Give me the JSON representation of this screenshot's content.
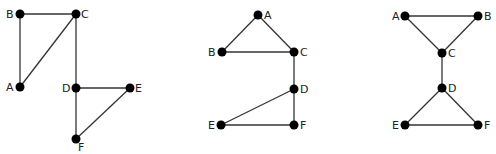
{
  "graphs": [
    {
      "id": "graph-1",
      "nodes": [
        {
          "label": "A",
          "x": 20,
          "y": 87,
          "lx": 6,
          "ly": 91
        },
        {
          "label": "B",
          "x": 20,
          "y": 14,
          "lx": 6,
          "ly": 18
        },
        {
          "label": "C",
          "x": 76,
          "y": 14,
          "lx": 81,
          "ly": 18
        },
        {
          "label": "D",
          "x": 76,
          "y": 88,
          "lx": 62,
          "ly": 92
        },
        {
          "label": "E",
          "x": 130,
          "y": 88,
          "lx": 135,
          "ly": 92
        },
        {
          "label": "F",
          "x": 76,
          "y": 139,
          "lx": 78,
          "ly": 151
        }
      ],
      "edges": [
        [
          "A",
          "B"
        ],
        [
          "B",
          "C"
        ],
        [
          "A",
          "C"
        ],
        [
          "C",
          "D"
        ],
        [
          "D",
          "E"
        ],
        [
          "D",
          "F"
        ],
        [
          "E",
          "F"
        ]
      ]
    },
    {
      "id": "graph-2",
      "nodes": [
        {
          "label": "A",
          "x": 258,
          "y": 15,
          "lx": 264,
          "ly": 19
        },
        {
          "label": "B",
          "x": 222,
          "y": 52,
          "lx": 208,
          "ly": 56
        },
        {
          "label": "C",
          "x": 294,
          "y": 52,
          "lx": 300,
          "ly": 56
        },
        {
          "label": "D",
          "x": 294,
          "y": 89,
          "lx": 300,
          "ly": 93
        },
        {
          "label": "E",
          "x": 221,
          "y": 125,
          "lx": 208,
          "ly": 129
        },
        {
          "label": "F",
          "x": 294,
          "y": 125,
          "lx": 300,
          "ly": 129
        }
      ],
      "edges": [
        [
          "A",
          "B"
        ],
        [
          "A",
          "C"
        ],
        [
          "B",
          "C"
        ],
        [
          "C",
          "D"
        ],
        [
          "D",
          "E"
        ],
        [
          "D",
          "F"
        ],
        [
          "E",
          "F"
        ]
      ]
    },
    {
      "id": "graph-3",
      "nodes": [
        {
          "label": "A",
          "x": 405,
          "y": 16,
          "lx": 392,
          "ly": 20
        },
        {
          "label": "B",
          "x": 478,
          "y": 16,
          "lx": 484,
          "ly": 20
        },
        {
          "label": "C",
          "x": 442,
          "y": 53,
          "lx": 448,
          "ly": 57
        },
        {
          "label": "D",
          "x": 442,
          "y": 88,
          "lx": 448,
          "ly": 92
        },
        {
          "label": "E",
          "x": 405,
          "y": 125,
          "lx": 392,
          "ly": 129
        },
        {
          "label": "F",
          "x": 478,
          "y": 125,
          "lx": 484,
          "ly": 129
        }
      ],
      "edges": [
        [
          "A",
          "B"
        ],
        [
          "A",
          "C"
        ],
        [
          "B",
          "C"
        ],
        [
          "C",
          "D"
        ],
        [
          "D",
          "E"
        ],
        [
          "D",
          "F"
        ],
        [
          "E",
          "F"
        ]
      ]
    }
  ],
  "style": {
    "node_color": "#000000",
    "edge_color": "#333333",
    "node_radius": 4.5
  }
}
